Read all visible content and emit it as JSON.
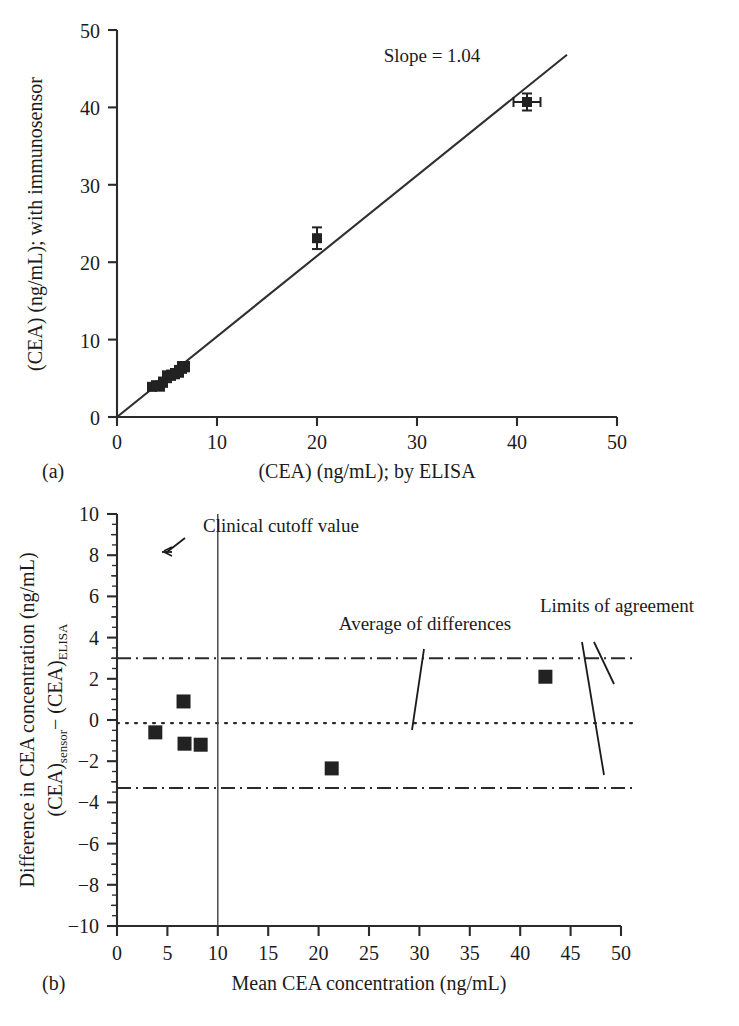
{
  "figure": {
    "panel_a_letter": "(a)",
    "panel_b_letter": "(b)"
  },
  "panel_a": {
    "xlabel": "(CEA) (ng/mL); by ELISA",
    "ylabel": "(CEA) (ng/mL); with immunosensor",
    "annotation": "Slope = 1.04",
    "xticks": [
      "0",
      "10",
      "20",
      "30",
      "40",
      "50"
    ],
    "yticks": [
      "0",
      "10",
      "20",
      "30",
      "40",
      "50"
    ]
  },
  "panel_b": {
    "xlabel": "Mean CEA concentration (ng/mL)",
    "ylabel_line1": "Difference in CEA concentration (ng/mL)",
    "ylabel_line2_a": "(CEA)",
    "ylabel_line2_sub1": "sensor",
    "ylabel_line2_b": "− (CEA)",
    "ylabel_line2_sub2": "ELISA",
    "xticks": [
      "0",
      "5",
      "10",
      "15",
      "20",
      "25",
      "30",
      "35",
      "40",
      "45",
      "50"
    ],
    "yticks": [
      "10",
      "8",
      "6",
      "4",
      "2",
      "0",
      "−2",
      "−4",
      "−6",
      "−8",
      "−10"
    ],
    "annotations": {
      "cutoff": "Clinical cutoff value",
      "average": "Average of differences",
      "limits": "Limits of agreement"
    }
  },
  "chart_data": [
    {
      "type": "scatter",
      "panel": "a",
      "title": "",
      "xlabel": "(CEA) (ng/mL); by ELISA",
      "ylabel": "(CEA) (ng/mL); with immunosensor",
      "xlim": [
        0,
        50
      ],
      "ylim": [
        0,
        50
      ],
      "xticks": [
        0,
        10,
        20,
        30,
        40,
        50
      ],
      "yticks": [
        0,
        10,
        20,
        30,
        40,
        50
      ],
      "grid": false,
      "legend": "none",
      "annotations": [
        {
          "text": "Slope = 1.04",
          "x": 31.5,
          "y": 46.0
        }
      ],
      "fit_line": {
        "slope": 1.04,
        "intercept": 0.0,
        "x_start": 0.0,
        "x_end": 45.0,
        "label": "Slope = 1.04"
      },
      "points": [
        {
          "x": 3.5,
          "y": 3.9,
          "xerr": 0.0,
          "yerr": 0.45
        },
        {
          "x": 3.9,
          "y": 4.1,
          "xerr": 0.0,
          "yerr": 0.45
        },
        {
          "x": 4.3,
          "y": 4.0,
          "xerr": 0.0,
          "yerr": 0.6
        },
        {
          "x": 4.6,
          "y": 4.5,
          "xerr": 0.0,
          "yerr": 0.6
        },
        {
          "x": 5.0,
          "y": 5.2,
          "xerr": 0.0,
          "yerr": 0.7
        },
        {
          "x": 5.4,
          "y": 5.4,
          "xerr": 0.0,
          "yerr": 0.6
        },
        {
          "x": 5.8,
          "y": 5.6,
          "xerr": 0.0,
          "yerr": 0.6
        },
        {
          "x": 6.2,
          "y": 5.9,
          "xerr": 0.0,
          "yerr": 0.7
        },
        {
          "x": 6.5,
          "y": 6.4,
          "xerr": 0.0,
          "yerr": 0.7
        },
        {
          "x": 6.8,
          "y": 6.5,
          "xerr": 0.0,
          "yerr": 0.6
        },
        {
          "x": 20.0,
          "y": 23.1,
          "xerr": 0.0,
          "yerr": 1.4
        },
        {
          "x": 41.0,
          "y": 40.7,
          "xerr": 1.35,
          "yerr": 1.1
        }
      ]
    },
    {
      "type": "scatter",
      "panel": "b",
      "title": "",
      "xlabel": "Mean CEA concentration (ng/mL)",
      "ylabel": "Difference in CEA concentration (ng/mL) (CEA)sensor − (CEA)ELISA",
      "xlim": [
        0,
        50
      ],
      "ylim": [
        -10,
        10
      ],
      "xticks": [
        0,
        5,
        10,
        15,
        20,
        25,
        30,
        35,
        40,
        45,
        50
      ],
      "yticks": [
        -10,
        -8,
        -6,
        -4,
        -2,
        0,
        2,
        4,
        6,
        8,
        10
      ],
      "grid": false,
      "legend": "none",
      "points": [
        {
          "x": 3.8,
          "y": -0.6
        },
        {
          "x": 6.6,
          "y": 0.9
        },
        {
          "x": 6.7,
          "y": -1.15
        },
        {
          "x": 8.3,
          "y": -1.2
        },
        {
          "x": 21.3,
          "y": -2.35
        },
        {
          "x": 42.5,
          "y": 2.1
        }
      ],
      "reference_lines": [
        {
          "name": "Average of differences",
          "orientation": "horizontal",
          "value": -0.15,
          "style": "dotted"
        },
        {
          "name": "Upper limit of agreement",
          "orientation": "horizontal",
          "value": 3.0,
          "style": "dash-dot"
        },
        {
          "name": "Lower limit of agreement",
          "orientation": "horizontal",
          "value": -3.3,
          "style": "dash-dot"
        },
        {
          "name": "Clinical cutoff value",
          "orientation": "vertical",
          "value": 10.0,
          "style": "solid"
        }
      ],
      "annotations": [
        {
          "text": "Clinical cutoff value",
          "x": 16.0,
          "y": 9.6
        },
        {
          "text": "Average of differences",
          "x": 22.0,
          "y": 5.4
        },
        {
          "text": "Limits of agreement",
          "x": 39.0,
          "y": 6.6
        }
      ]
    }
  ]
}
